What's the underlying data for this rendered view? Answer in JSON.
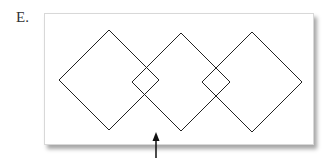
{
  "figure": {
    "label": "E.",
    "stroke_color": "#222222",
    "diamonds": [
      {
        "name": "left",
        "cx": 109,
        "cy": 80,
        "half": 50
      },
      {
        "name": "middle",
        "cx": 181,
        "cy": 82,
        "half": 49
      },
      {
        "name": "right",
        "cx": 252,
        "cy": 82,
        "half": 50
      }
    ],
    "arrow": {
      "x": 156,
      "tip_y": 132,
      "tail_y": 158,
      "direction": "up"
    }
  }
}
